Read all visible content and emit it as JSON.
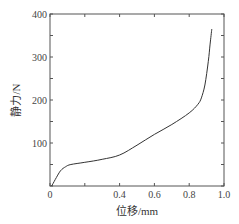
{
  "chart_data": {
    "type": "line",
    "title": "",
    "xlabel": "位移/mm",
    "ylabel": "静力/N",
    "xlim": [
      0,
      1.0
    ],
    "ylim": [
      0,
      400
    ],
    "grid": false,
    "legend": null,
    "x_ticks": [
      0,
      0.2,
      0.4,
      0.6,
      0.8,
      1.0
    ],
    "x_tick_labels": [
      "0",
      "",
      "0.4",
      "0.6",
      "0.8",
      "1.0"
    ],
    "y_ticks": [
      0,
      50,
      100,
      150,
      200,
      250,
      300,
      350,
      400
    ],
    "y_tick_labels": [
      "",
      "",
      "100",
      "",
      "200",
      "",
      "300",
      "",
      "400"
    ],
    "series": [
      {
        "name": "静力-位移",
        "color": "#333333",
        "x": [
          0.01,
          0.03,
          0.06,
          0.09,
          0.12,
          0.2,
          0.3,
          0.4,
          0.5,
          0.6,
          0.7,
          0.8,
          0.85,
          0.87,
          0.89,
          0.91,
          0.92,
          0.93
        ],
        "y": [
          0,
          15,
          35,
          45,
          50,
          55,
          62,
          72,
          95,
          120,
          143,
          170,
          190,
          205,
          235,
          290,
          330,
          365
        ]
      }
    ]
  }
}
